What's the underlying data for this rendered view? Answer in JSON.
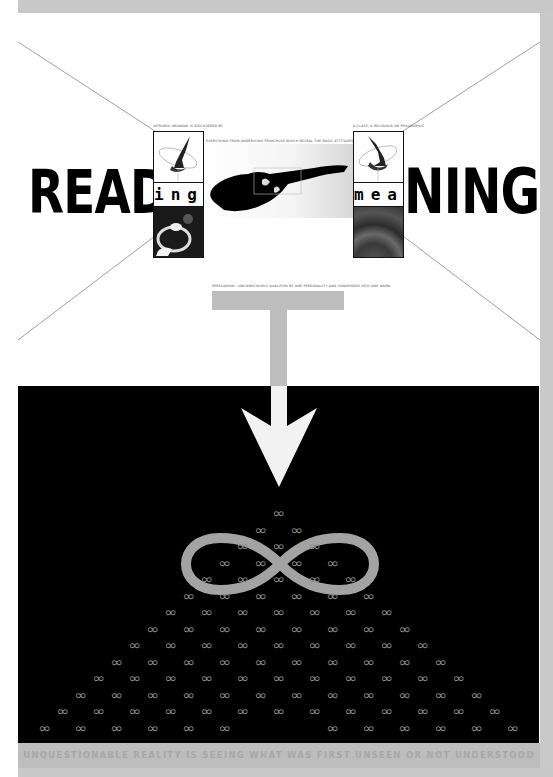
{
  "poster": {
    "title_left": {
      "big": "READ",
      "small": "ing"
    },
    "title_right": {
      "small": "mea",
      "big": "NING"
    },
    "captions": {
      "left_box": "INTRINSIC MEANING IS DISCOVERED BY",
      "center_top": "EVERYTHING FROM UNDERLYING PRINCIPLES WHICH REVEAL THE BASIC ATTITUDES OF A NATION, A PERIOD",
      "right_box": "A CLASS, A RELIGIOUS OR PHILOSOPHIC",
      "under_center": "PERSUASION : UNCONSCIOUSLY QUALIFIED BY ONE PERSONALITY AND CONDENSED INTO ONE WORK"
    },
    "tagline": "UNQUESTIONABLE REALITY IS SEEING WHAT WAS FIRST UNSEEN OR NOT UNDERSTOOD",
    "infinity_glyph": "∞",
    "pyramid": {
      "rows": 14,
      "apex_x": 279,
      "apex_y": 513,
      "row_step": 16.5,
      "col_step": 36,
      "missing_in_last_row": [
        6,
        7
      ]
    },
    "colors": {
      "background": "#ffffff",
      "frame_gray": "#c8c8c8",
      "panel_black": "#000000",
      "accent_gray": "#bdbdbd",
      "arrow_white": "#f2f2f2",
      "small_infinity": "#8a8a8a"
    },
    "icons": [
      "arrow-down-icon",
      "infinity-icon",
      "t-shape-icon"
    ]
  }
}
